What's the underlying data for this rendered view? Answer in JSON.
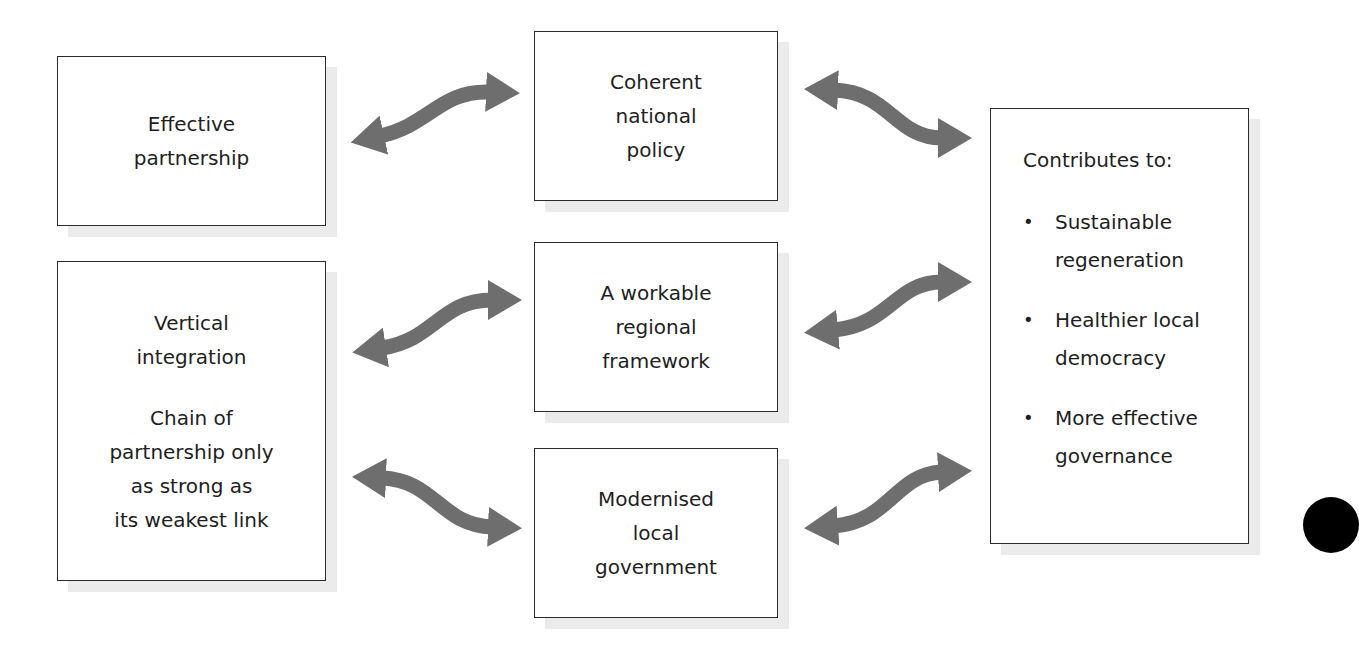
{
  "diagram": {
    "left_column": {
      "effective_partnership": {
        "lines": [
          "Effective",
          "partnership"
        ]
      },
      "vertical_integration": {
        "title_lines": [
          "Vertical",
          "integration"
        ],
        "body_lines": [
          "Chain of",
          "partnership only",
          "as strong as",
          "its weakest link"
        ]
      }
    },
    "middle_column": {
      "coherent_policy": {
        "lines": [
          "Coherent",
          "national",
          "policy"
        ]
      },
      "regional_framework": {
        "lines": [
          "A workable",
          "regional",
          "framework"
        ]
      },
      "local_government": {
        "lines": [
          "Modernised",
          "local",
          "government"
        ]
      }
    },
    "right_column": {
      "contributes": {
        "heading": "Contributes to:",
        "bullet_glyph": "•",
        "items": [
          {
            "lines": [
              "Sustainable",
              "regeneration"
            ]
          },
          {
            "lines": [
              "Healthier local",
              "democracy"
            ]
          },
          {
            "lines": [
              "More effective",
              "governance"
            ]
          }
        ]
      }
    },
    "connectors": [
      {
        "id": "effective-coherent",
        "type": "double-headed-curved-arrow"
      },
      {
        "id": "coherent-contrib",
        "type": "double-headed-curved-arrow"
      },
      {
        "id": "vertical-regional",
        "type": "double-headed-curved-arrow"
      },
      {
        "id": "vertical-local",
        "type": "double-headed-curved-arrow"
      },
      {
        "id": "regional-contrib",
        "type": "double-headed-curved-arrow"
      },
      {
        "id": "local-contrib",
        "type": "double-headed-curved-arrow"
      }
    ],
    "colors": {
      "arrow": "#6e6e6e",
      "box_border": "#2a2a2a",
      "box_shadow": "#ebebeb",
      "text": "#1e1e1e"
    }
  }
}
